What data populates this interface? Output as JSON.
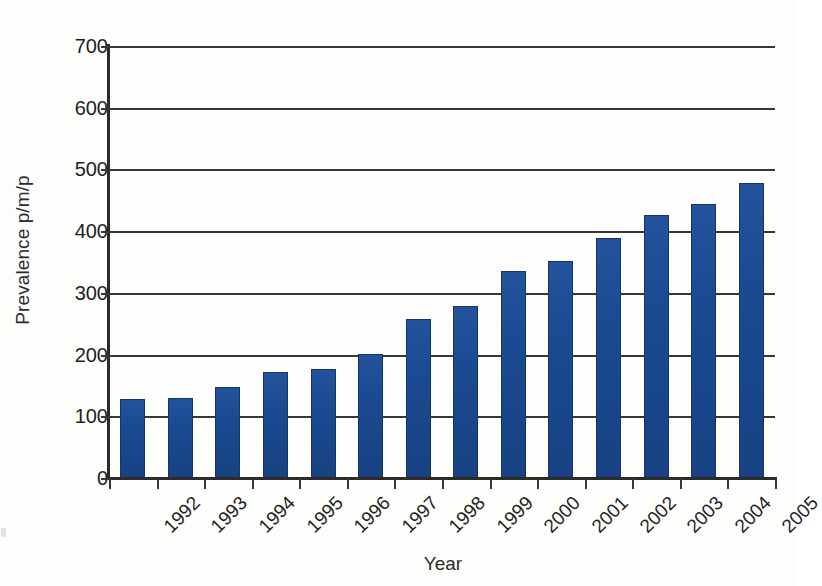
{
  "chart_data": {
    "type": "bar",
    "title": "",
    "subtitle": "",
    "xlabel": "Year",
    "ylabel": "Prevalence p/m/p",
    "categories": [
      "1992",
      "1993",
      "1994",
      "1995",
      "1996",
      "1997",
      "1998",
      "1999",
      "2000",
      "2001",
      "2002",
      "2003",
      "2004",
      "2005"
    ],
    "values": [
      128,
      130,
      148,
      172,
      176,
      201,
      258,
      278,
      335,
      352,
      389,
      426,
      444,
      478
    ],
    "series": [
      {
        "name": "Prevalence",
        "values": [
          128,
          130,
          148,
          172,
          176,
          201,
          258,
          278,
          335,
          352,
          389,
          426,
          444,
          478
        ]
      }
    ],
    "ylim": [
      0,
      700
    ],
    "y_ticks": [
      0,
      100,
      200,
      300,
      400,
      500,
      600,
      700
    ],
    "y_tick_labels": [
      "0",
      "100",
      "200",
      "300",
      "400",
      "500",
      "600",
      "700"
    ],
    "grid": "horizontal",
    "legend": "none",
    "bar_color": "#1a4a91",
    "bar_border_color": "#15365f",
    "axis_color": "#2e2a28",
    "gridline_color": "#3a3532",
    "background_color": "#fdfdfb",
    "x_label_rotation": -45
  },
  "axes": {
    "y_title": "Prevalence p/m/p",
    "x_title": "Year"
  }
}
